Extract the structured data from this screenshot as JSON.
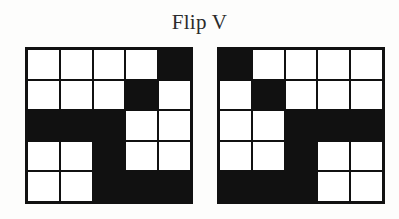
{
  "title": "Flip V",
  "colors": {
    "filled": "#111111",
    "empty": "#ffffff",
    "background": "#fdfdfc",
    "text": "#2b2b2b"
  },
  "grids": [
    {
      "name": "source-grid",
      "rows": 5,
      "cols": 5,
      "cells": [
        [
          0,
          0,
          0,
          0,
          1
        ],
        [
          0,
          0,
          0,
          1,
          0
        ],
        [
          1,
          1,
          1,
          0,
          0
        ],
        [
          0,
          0,
          1,
          0,
          0
        ],
        [
          0,
          0,
          1,
          1,
          1
        ]
      ]
    },
    {
      "name": "result-grid",
      "rows": 5,
      "cols": 5,
      "cells": [
        [
          1,
          0,
          0,
          0,
          0
        ],
        [
          0,
          1,
          0,
          0,
          0
        ],
        [
          0,
          0,
          1,
          1,
          1
        ],
        [
          0,
          0,
          1,
          0,
          0
        ],
        [
          1,
          1,
          1,
          0,
          0
        ]
      ]
    }
  ]
}
